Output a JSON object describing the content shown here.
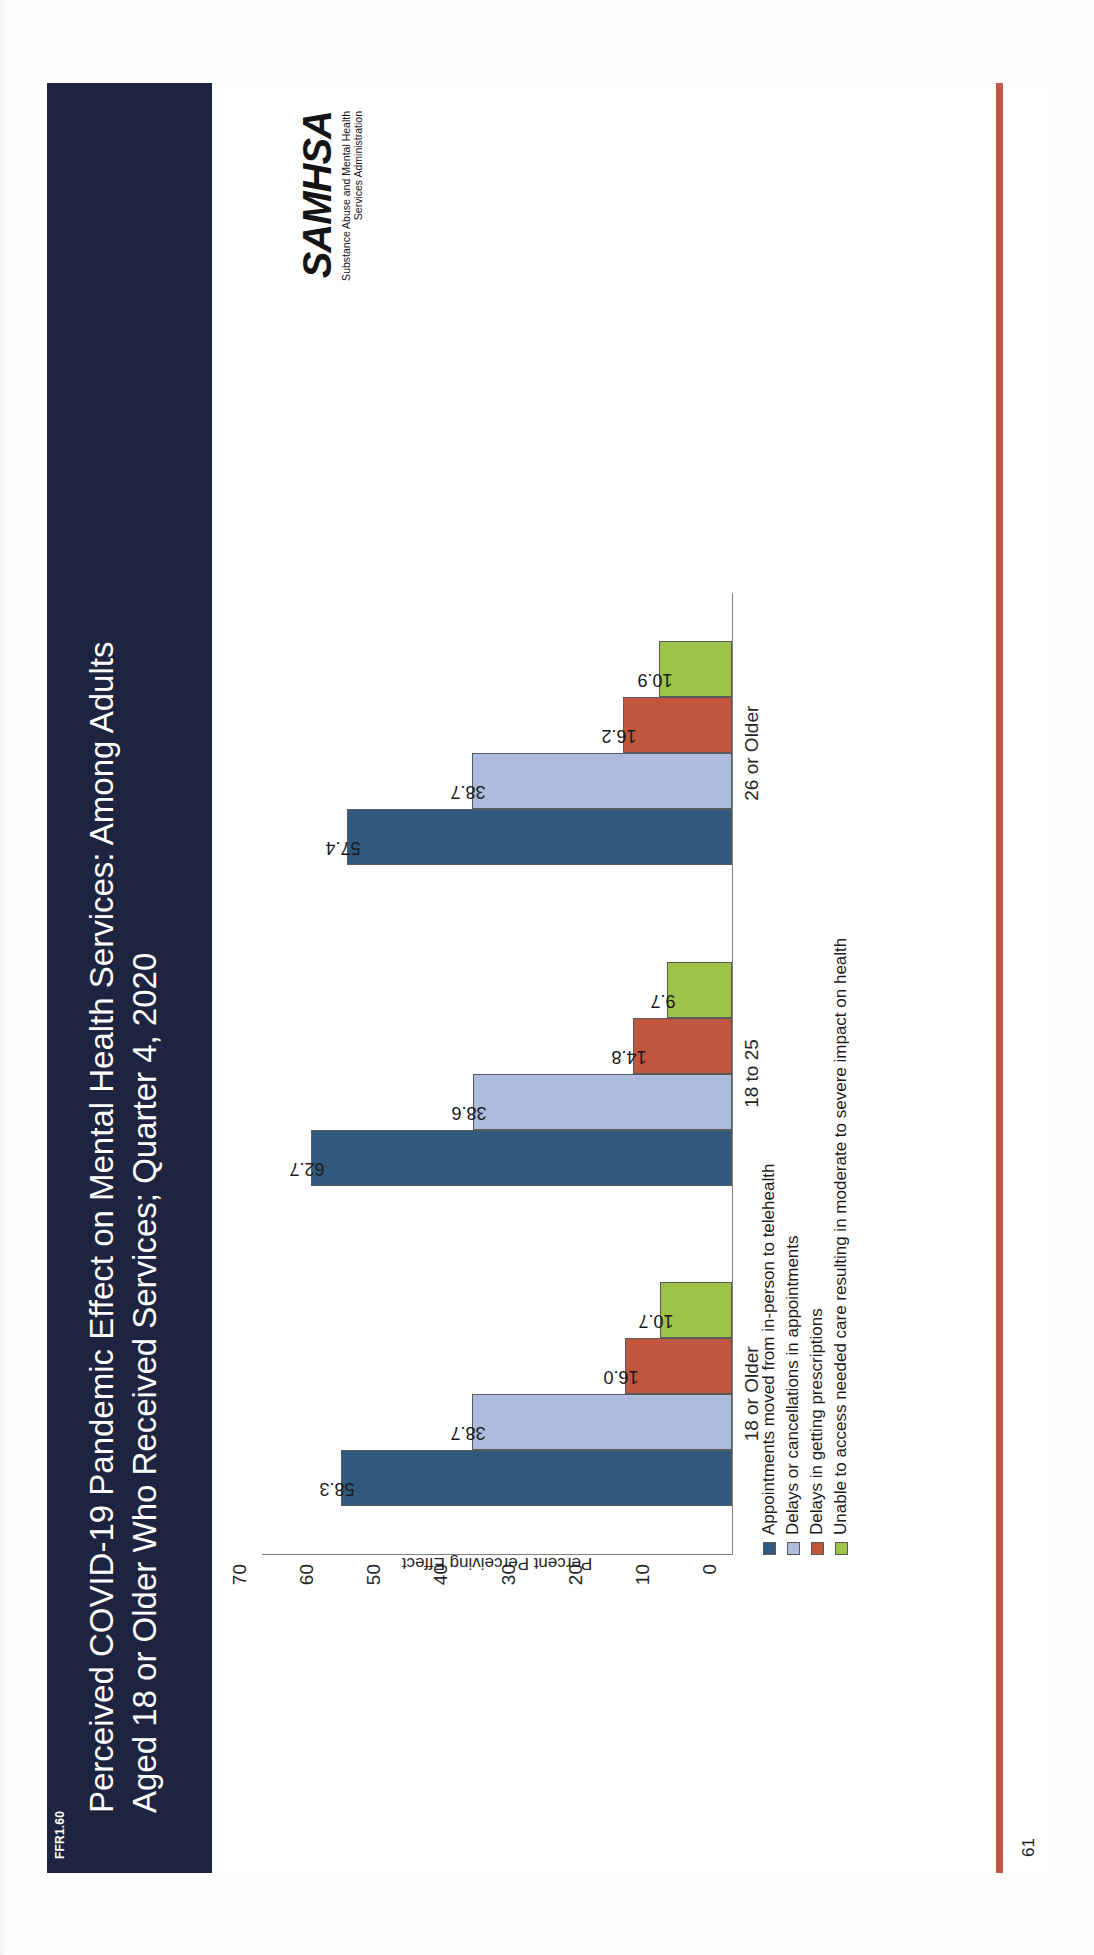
{
  "header": {
    "tag": "FFR1.60",
    "title_line1": "Perceived COVID-19 Pandemic Effect on Mental Health Services: Among Adults",
    "title_line2": "Aged 18 or Older Who Received Services; Quarter 4, 2020",
    "band_color": "#1e2440",
    "text_color": "#ffffff"
  },
  "footer": {
    "page_number": "61",
    "rule_color": "#c0564a"
  },
  "logo": {
    "mark": "SAMHSA",
    "sub_line1": "Substance Abuse and Mental Health",
    "sub_line2": "Services Administration"
  },
  "chart_data": {
    "type": "bar",
    "title": "Perceived COVID-19 Pandemic Effect on Mental Health Services: Among Adults Aged 18 or Older Who Received Services; Quarter 4, 2020",
    "xlabel": "",
    "ylabel": "Percent Perceiving Effect",
    "ylim": [
      0,
      70
    ],
    "yticks": [
      70,
      60,
      50,
      40,
      30,
      20,
      10,
      0
    ],
    "grid": false,
    "legend_position": "bottom-left",
    "categories": [
      "18 or Older",
      "18 to 25",
      "26 or Older"
    ],
    "series": [
      {
        "name": "Appointments moved from in-person to telehealth",
        "color": "#31597d",
        "values": [
          58.3,
          62.7,
          57.4
        ],
        "labels": [
          "58.3",
          "62.7",
          "57.4"
        ]
      },
      {
        "name": "Delays or cancellations in appointments",
        "color": "#adbbdd",
        "values": [
          38.7,
          38.6,
          38.7
        ],
        "labels": [
          "38.7",
          "38.6",
          "38.7"
        ]
      },
      {
        "name": "Delays in getting prescriptions",
        "color": "#c0563e",
        "values": [
          16.0,
          14.8,
          16.2
        ],
        "labels": [
          "16.0",
          "14.8",
          "16.2"
        ]
      },
      {
        "name": "Unable to access needed care resulting in moderate to severe impact on health",
        "color": "#9ac martyr",
        "values": [
          10.7,
          9.7,
          10.9
        ],
        "labels": [
          "10.7",
          "9.7",
          "10.9"
        ]
      }
    ]
  }
}
